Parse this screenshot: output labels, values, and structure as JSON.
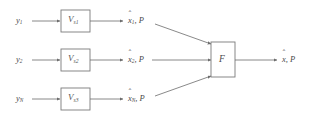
{
  "diagram": {
    "type": "block-diagram",
    "colors": {
      "line": "#6b6b6b",
      "text": "#4a4a4a",
      "background": "#ffffff",
      "box_stroke": "#7a7a7a"
    },
    "rows": [
      {
        "input_label": "y",
        "input_sub": "1",
        "block_label": "V",
        "block_sub": "s1",
        "output_state": "x",
        "output_sub": "1",
        "output_cov": ", P"
      },
      {
        "input_label": "y",
        "input_sub": "2",
        "block_label": "V",
        "block_sub": "s2",
        "output_state": "x",
        "output_sub": "2",
        "output_cov": ", P"
      },
      {
        "input_label": "y",
        "input_sub": "N",
        "block_label": "V",
        "block_sub": "s3",
        "output_state": "x",
        "output_sub": "N",
        "output_cov": ", P"
      }
    ],
    "fusion": {
      "label": "F"
    },
    "final_output": {
      "state": "x",
      "cov": ", P"
    },
    "hat_glyph": "ˆ"
  }
}
